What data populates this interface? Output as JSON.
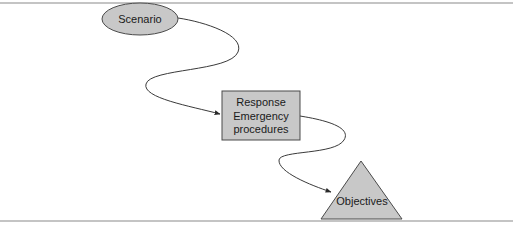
{
  "diagram": {
    "nodes": {
      "scenario": {
        "label": "Scenario",
        "shape": "ellipse"
      },
      "response": {
        "label_line1": "Response",
        "label_line2": "Emergency",
        "label_line3": "procedures",
        "shape": "rectangle"
      },
      "objectives": {
        "label": "Objectives",
        "shape": "triangle"
      }
    },
    "edges": [
      {
        "from": "scenario",
        "to": "response"
      },
      {
        "from": "response",
        "to": "objectives"
      }
    ],
    "colors": {
      "node_fill": "#c8c8c8",
      "stroke": "#4a4a4a",
      "rule": "#8a8a8a"
    }
  }
}
